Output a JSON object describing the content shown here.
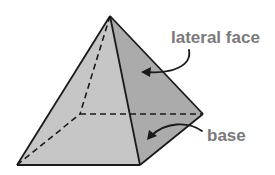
{
  "diagram": {
    "labels": {
      "lateral_face": "lateral face",
      "base": "base"
    },
    "colors": {
      "front_face": "#c6c6c6",
      "side_face": "#ababab",
      "edge": "#1a1a1a",
      "label_text": "#7a7a7a",
      "background": "#ffffff"
    },
    "vertices": {
      "apex": [
        110,
        16
      ],
      "front_left": [
        17,
        165
      ],
      "front_right": [
        140,
        165
      ],
      "back_right": [
        203,
        114
      ],
      "back_left_hidden": [
        80,
        114
      ]
    }
  }
}
